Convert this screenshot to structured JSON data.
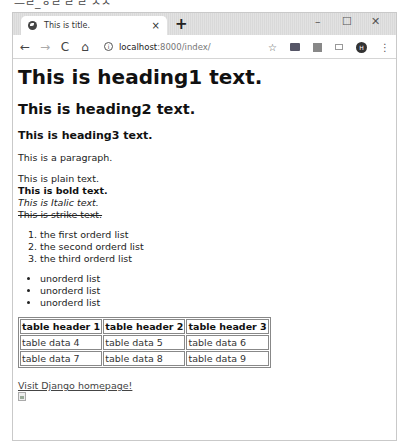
{
  "caption": "—ㄹ_ㅎㄹ ㄹ ㄹ ㅅㅅ",
  "browser": {
    "tab": {
      "title": "This is title.",
      "close": "×"
    },
    "new_tab": "+",
    "window_controls": {
      "minimize": "–",
      "maximize": "☐",
      "close": "✕"
    },
    "nav": {
      "back": "←",
      "forward": "→",
      "reload": "C",
      "home": "⌂"
    },
    "address": {
      "host": "localhost",
      "path": ":8000/index/"
    },
    "icons": [
      "star-icon",
      "extension-icon-1",
      "extension-icon-2",
      "cast-icon",
      "profile-avatar",
      "menu-icon"
    ],
    "avatar_initial": "H",
    "star": "☆",
    "menu": "⋮"
  },
  "page": {
    "h1": "This is heading1 text.",
    "h2": "This is heading2 text.",
    "h3": "This is heading3 text.",
    "paragraph": "This is a paragraph.",
    "plain": "This is plain text.",
    "bold": "This is bold text.",
    "italic": "This is Italic text.",
    "strike": "This is strike text.",
    "ordered_list": [
      "the first orderd list",
      "the second orderd list",
      "the third orderd list"
    ],
    "unordered_list": [
      "unorderd list",
      "unorderd list",
      "unorderd list"
    ],
    "table": {
      "headers": [
        "table header 1",
        "table header 2",
        "table header 3"
      ],
      "rows": [
        [
          "table data 4",
          "table data 5",
          "table data 6"
        ],
        [
          "table data 7",
          "table data 8",
          "table data 9"
        ]
      ]
    },
    "link": "Visit Django homepage!"
  }
}
